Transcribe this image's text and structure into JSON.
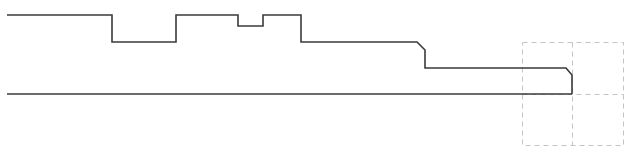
{
  "diagram": {
    "type": "shaft-profile-drawing",
    "caption": "",
    "colors": {
      "background": "#ffffff",
      "profile_stroke": "#3a3a3a",
      "grid_stroke": "#c4c4c4"
    },
    "profile": {
      "description": "Stepped shaft half-profile with a groove, a notch and two chamfered shoulders",
      "features": [
        {
          "name": "shoulder-left",
          "kind": "step"
        },
        {
          "name": "groove",
          "kind": "recess"
        },
        {
          "name": "collar",
          "kind": "raised"
        },
        {
          "name": "notch",
          "kind": "recess"
        },
        {
          "name": "collar-right",
          "kind": "raised"
        },
        {
          "name": "middle-section",
          "kind": "step"
        },
        {
          "name": "chamfer-1",
          "kind": "chamfer"
        },
        {
          "name": "end-section",
          "kind": "step"
        },
        {
          "name": "chamfer-2",
          "kind": "chamfer"
        }
      ]
    },
    "axis_line": {
      "label": "centerline"
    },
    "selection_grid": {
      "rows": 2,
      "cols": 2,
      "style": "dashed"
    }
  }
}
